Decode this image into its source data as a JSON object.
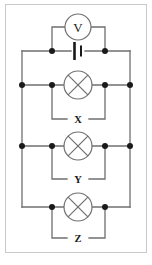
{
  "figure": {
    "background_color": "#ffffff",
    "wire_color": "#6f6f6f",
    "node_color": "#1a1a1a",
    "border_color": "#c9c9c9"
  },
  "components": {
    "voltmeter": {
      "symbol": "V",
      "name": "voltmeter",
      "cx": 78,
      "cy": 27,
      "r": 13
    },
    "cell": {
      "name": "cell-battery",
      "cx": 78,
      "cy": 51
    },
    "lamps": [
      {
        "label": "X",
        "name": "lamp-x",
        "cx": 78,
        "cy": 85,
        "r": 14,
        "label_x": 78,
        "label_y": 119
      },
      {
        "label": "Y",
        "name": "lamp-y",
        "cx": 78,
        "cy": 146,
        "r": 14,
        "label_x": 78,
        "label_y": 179
      },
      {
        "label": "Z",
        "name": "lamp-z",
        "cx": 78,
        "cy": 207,
        "r": 14,
        "label_x": 78,
        "label_y": 238
      }
    ]
  },
  "rails": {
    "left_outer_x": 22,
    "right_outer_x": 130,
    "left_inner_x": 52,
    "right_inner_x": 105,
    "rows": {
      "voltmeter_row_y": 27,
      "cell_row_y": 51,
      "x_row_y": 85,
      "y_row_y": 146,
      "z_row_y": 207
    }
  },
  "junction_dots": [
    {
      "name": "dot-cell-left",
      "x": 52,
      "y": 51
    },
    {
      "name": "dot-cell-right",
      "x": 105,
      "y": 51
    },
    {
      "name": "dot-x-outer-left",
      "x": 22,
      "y": 85
    },
    {
      "name": "dot-x-inner-left",
      "x": 52,
      "y": 85
    },
    {
      "name": "dot-x-inner-right",
      "x": 105,
      "y": 85
    },
    {
      "name": "dot-x-outer-right",
      "x": 130,
      "y": 85
    },
    {
      "name": "dot-y-outer-left",
      "x": 22,
      "y": 146
    },
    {
      "name": "dot-y-inner-left",
      "x": 52,
      "y": 146
    },
    {
      "name": "dot-y-inner-right",
      "x": 105,
      "y": 146
    },
    {
      "name": "dot-y-outer-right",
      "x": 130,
      "y": 146
    },
    {
      "name": "dot-z-inner-left",
      "x": 52,
      "y": 207
    },
    {
      "name": "dot-z-inner-right",
      "x": 105,
      "y": 207
    }
  ],
  "labels": {
    "voltmeter_glyph": "V",
    "lamp_x": "X",
    "lamp_y": "Y",
    "lamp_z": "Z"
  }
}
